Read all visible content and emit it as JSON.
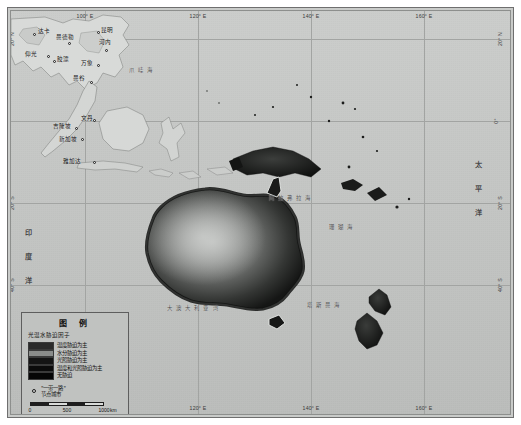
{
  "map": {
    "projection_note": "",
    "background_color": "#c6c8c6",
    "frame_color": "#6f6f6f",
    "grid_color": "#a2a4a2",
    "lon_ticks": [
      {
        "label": "100° E",
        "x": 74
      },
      {
        "label": "120° E",
        "x": 187
      },
      {
        "label": "140° E",
        "x": 300
      },
      {
        "label": "160° E",
        "x": 413
      }
    ],
    "lat_ticks": [
      {
        "label": "20° N",
        "y": 28
      },
      {
        "label": "0°",
        "y": 110
      },
      {
        "label": "20° S",
        "y": 192
      },
      {
        "label": "40° S",
        "y": 274
      }
    ],
    "lat_ticks_right": [
      {
        "label": "20° N",
        "y": 28
      },
      {
        "label": "0°",
        "y": 110
      },
      {
        "label": "20° S",
        "y": 192
      },
      {
        "label": "40° S",
        "y": 274
      }
    ],
    "oceans": [
      {
        "name": "太 平 洋",
        "x": 462,
        "y": 150,
        "vertical": true
      },
      {
        "name": "印 度 洋",
        "x": 12,
        "y": 218,
        "vertical": true
      }
    ],
    "seas": [
      {
        "name": "阿 拉 弗 拉 海",
        "x": 258,
        "y": 183
      },
      {
        "name": "大 澳 大 利 亚 湾",
        "x": 156,
        "y": 293
      },
      {
        "name": "塔 斯 曼 海",
        "x": 296,
        "y": 290
      },
      {
        "name": "珊 瑚 海",
        "x": 318,
        "y": 212
      },
      {
        "name": "爪 哇 海",
        "x": 118,
        "y": 55
      }
    ],
    "cities": [
      {
        "name": "达卡",
        "dot_x": 22,
        "dot_y": 22,
        "label_x": 27,
        "label_y": 16
      },
      {
        "name": "曼德勒",
        "dot_x": 57,
        "dot_y": 31,
        "label_x": 45,
        "label_y": 22
      },
      {
        "name": "昆明",
        "dot_x": 86,
        "dot_y": 20,
        "label_x": 90,
        "label_y": 15
      },
      {
        "name": "河内",
        "dot_x": 94,
        "dot_y": 38,
        "label_x": 88,
        "label_y": 27
      },
      {
        "name": "仰光",
        "dot_x": 36,
        "dot_y": 44,
        "label_x": 14,
        "label_y": 39
      },
      {
        "name": "胶漂",
        "dot_x": 42,
        "dot_y": 49,
        "label_x": 46,
        "label_y": 44
      },
      {
        "name": "万象",
        "dot_x": 86,
        "dot_y": 53,
        "label_x": 70,
        "label_y": 48
      },
      {
        "name": "曼谷",
        "dot_x": 79,
        "dot_y": 70,
        "label_x": 62,
        "label_y": 63
      },
      {
        "name": "文丹",
        "dot_x": 82,
        "dot_y": 108,
        "label_x": 70,
        "label_y": 103
      },
      {
        "name": "吉隆坡",
        "dot_x": 64,
        "dot_y": 116,
        "label_x": 42,
        "label_y": 111
      },
      {
        "name": "新加坡",
        "dot_x": 70,
        "dot_y": 127,
        "label_x": 48,
        "label_y": 124
      },
      {
        "name": "雅加达",
        "dot_x": 82,
        "dot_y": 150,
        "label_x": 52,
        "label_y": 146
      }
    ]
  },
  "legend": {
    "title": "图  例",
    "subtitle": "光温水胁迫因子",
    "entries": [
      {
        "label": "温度胁迫为主",
        "color": "#2b2b2b"
      },
      {
        "label": "水分胁迫为主",
        "color": "#8a8c8a"
      },
      {
        "label": "光照胁迫为主",
        "color": "#141414"
      },
      {
        "label": "温度和光照胁迫为主",
        "color": "#0b0b0b"
      },
      {
        "label": "无胁迫",
        "color": "#060606"
      }
    ],
    "city_marker_label_line1": "\"一带一路\"",
    "city_marker_label_line2": "节点城市",
    "scalebar": {
      "ticks": [
        "0",
        "500",
        "1000"
      ],
      "unit": "km"
    }
  }
}
